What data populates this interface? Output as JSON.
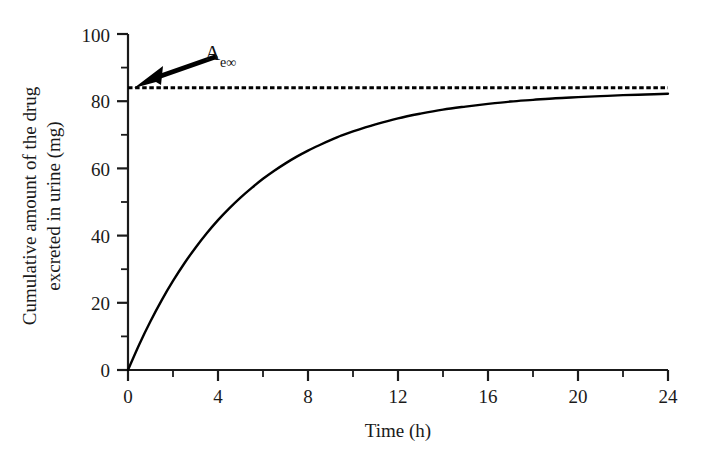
{
  "chart_data": {
    "type": "line",
    "title": "",
    "xlabel": "Time (h)",
    "ylabel": "Cumulative amount of the drug excreted in urine (mg)",
    "ylabel_line1": "Cumulative amount of the drug",
    "ylabel_line2": "excreted in urine (mg)",
    "xlim": [
      0,
      24
    ],
    "ylim": [
      0,
      100
    ],
    "grid": false,
    "legend": "none",
    "x_ticks": [
      0,
      4,
      8,
      12,
      16,
      20,
      24
    ],
    "x_tick_labels": [
      "0",
      "4",
      "8",
      "12",
      "16",
      "20",
      "24"
    ],
    "x_minor_ticks": [
      2,
      6,
      10,
      14,
      18,
      22
    ],
    "y_ticks": [
      0,
      20,
      40,
      60,
      80,
      100
    ],
    "y_tick_labels": [
      "0",
      "20",
      "40",
      "60",
      "80",
      "100"
    ],
    "y_minor_ticks": [
      10,
      30,
      50,
      70,
      90
    ],
    "series": [
      {
        "name": "Cumulative amount excreted",
        "style": "solid",
        "color": "#000000",
        "x": [
          0,
          0.5,
          1,
          1.5,
          2,
          2.5,
          3,
          3.5,
          4,
          4.5,
          5,
          5.5,
          6,
          6.5,
          7,
          7.5,
          8,
          8.5,
          9,
          9.5,
          10,
          11,
          12,
          13,
          14,
          15,
          16,
          17,
          18,
          19,
          20,
          21,
          22,
          23,
          24
        ],
        "y": [
          0.0,
          7.6,
          14.5,
          20.8,
          26.5,
          31.7,
          36.4,
          40.7,
          44.6,
          48.1,
          51.3,
          54.2,
          56.9,
          59.3,
          61.5,
          63.5,
          65.3,
          66.9,
          68.4,
          69.8,
          71.0,
          73.1,
          74.9,
          76.3,
          77.5,
          78.4,
          79.2,
          79.9,
          80.4,
          80.9,
          81.2,
          81.5,
          81.8,
          82.0,
          82.2
        ]
      }
    ],
    "asymptote": {
      "name": "Ae-infinity asymptote",
      "value": 84,
      "style": "dashed",
      "color": "#000000"
    },
    "annotations": [
      {
        "name": "ae-infinity-label",
        "text": "A",
        "subscript": "e∞",
        "points_to_value": 84
      }
    ]
  }
}
